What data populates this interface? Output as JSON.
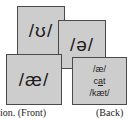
{
  "cards": {
    "front": [
      {
        "symbol": "/ʊ/"
      },
      {
        "symbol": "/ə/"
      },
      {
        "symbol": "/æ/"
      }
    ],
    "back": {
      "symbol": "/æ/",
      "word_prefix": "c",
      "word_underlined": "a",
      "word_suffix": "t",
      "transcription": "/kæt/"
    }
  },
  "captions": {
    "front": "ion.  (Front)",
    "back": "(Back)"
  },
  "colors": {
    "card_fill": "#cdcdcd",
    "card_border": "#4a4a4a",
    "text": "#1e1e1e"
  }
}
